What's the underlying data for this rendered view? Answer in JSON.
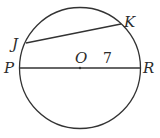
{
  "figure": {
    "type": "circle-geometry",
    "circle": {
      "cx": 80,
      "cy": 68,
      "r": 60,
      "stroke": "#333333"
    },
    "center": {
      "label": "O",
      "x": 80,
      "y": 68
    },
    "points": {
      "J": {
        "label": "J",
        "x": 26,
        "y": 43
      },
      "K": {
        "label": "K",
        "x": 121,
        "y": 24
      },
      "P": {
        "label": "P",
        "x": 20,
        "y": 68
      },
      "R": {
        "label": "R",
        "x": 140,
        "y": 68
      }
    },
    "segments": [
      {
        "from": "J",
        "to": "K",
        "name": "chord-JK"
      },
      {
        "from": "P",
        "to": "R",
        "name": "diameter-PR"
      }
    ],
    "measure": {
      "label": "7",
      "segment": "OR"
    }
  }
}
